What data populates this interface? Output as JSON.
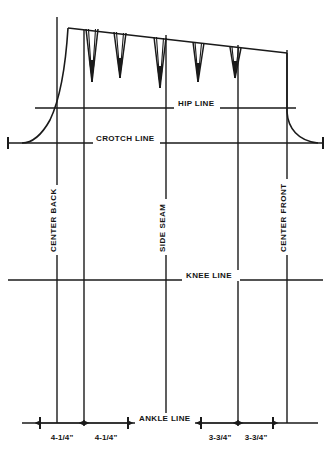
{
  "diagram": {
    "type": "technical-pattern-drawing",
    "background_color": "#ffffff",
    "line_color": "#1a1a1a",
    "horizontal_guides": [
      {
        "id": "hip",
        "label": "HIP LINE",
        "y": 108,
        "x_start": 35,
        "x_end": 296,
        "label_x": 178,
        "label_y": 106
      },
      {
        "id": "crotch",
        "label": "CROTCH LINE",
        "y": 143,
        "x_start": 8,
        "x_end": 323,
        "label_x": 96,
        "label_y": 141
      },
      {
        "id": "knee",
        "label": "KNEE LINE",
        "y": 280,
        "x_start": 8,
        "x_end": 323,
        "label_x": 186,
        "label_y": 278
      },
      {
        "id": "ankle",
        "label": "ANKLE  LINE",
        "y": 423,
        "x_start": 22,
        "x_end": 318,
        "label_x": 139,
        "label_y": 421
      }
    ],
    "vertical_guides": [
      {
        "id": "center-back",
        "label": "CENTER BACK",
        "x": 57,
        "label_y": 252
      },
      {
        "id": "back-inseam",
        "label": "",
        "x": 84,
        "label_y": 0
      },
      {
        "id": "side-seam",
        "label": "SIDE SEAM",
        "x": 166,
        "label_y": 252
      },
      {
        "id": "front-inseam",
        "label": "",
        "x": 238,
        "label_y": 0
      },
      {
        "id": "center-front",
        "label": "CENTER FRONT",
        "x": 287,
        "label_y": 252
      }
    ],
    "waist_darts": [
      {
        "id": "dart-1",
        "apex_x": 92,
        "tip_y": 82
      },
      {
        "id": "dart-2",
        "apex_x": 120,
        "tip_y": 78
      },
      {
        "id": "dart-3",
        "apex_x": 160,
        "tip_y": 88
      },
      {
        "id": "dart-4",
        "apex_x": 198,
        "tip_y": 82
      },
      {
        "id": "dart-5",
        "apex_x": 235,
        "tip_y": 78
      }
    ],
    "dimensions": [
      {
        "id": "dim-back-1",
        "value": "4-1/4\"",
        "x_start": 40,
        "x_end": 84,
        "label_x": 62,
        "label_y": 440
      },
      {
        "id": "dim-back-2",
        "value": "4-1/4\"",
        "x_start": 84,
        "x_end": 128,
        "label_x": 106,
        "label_y": 440
      },
      {
        "id": "dim-front-1",
        "value": "3-3/4\"",
        "x_start": 201,
        "x_end": 238,
        "label_x": 220,
        "label_y": 440
      },
      {
        "id": "dim-front-2",
        "value": "3-3/4\"",
        "x_start": 238,
        "x_end": 273,
        "label_x": 256,
        "label_y": 440
      }
    ],
    "end_caps": [
      {
        "id": "crotch-cap-left",
        "x": 8,
        "y": 143
      },
      {
        "id": "crotch-cap-right",
        "x": 323,
        "y": 143
      },
      {
        "id": "ankle-cap-back-start",
        "x": 40,
        "y": 423
      },
      {
        "id": "ankle-cap-back-end",
        "x": 128,
        "y": 423
      },
      {
        "id": "ankle-cap-front-start",
        "x": 201,
        "y": 423
      },
      {
        "id": "ankle-cap-front-end",
        "x": 273,
        "y": 423
      }
    ],
    "outline": {
      "waist_left_x": 68,
      "waist_left_y": 28,
      "waist_right_x": 287,
      "waist_right_y": 53,
      "left_curve_end_x": 22,
      "left_curve_end_y": 143,
      "right_curve_end_x": 318,
      "right_curve_end_y": 143
    }
  }
}
